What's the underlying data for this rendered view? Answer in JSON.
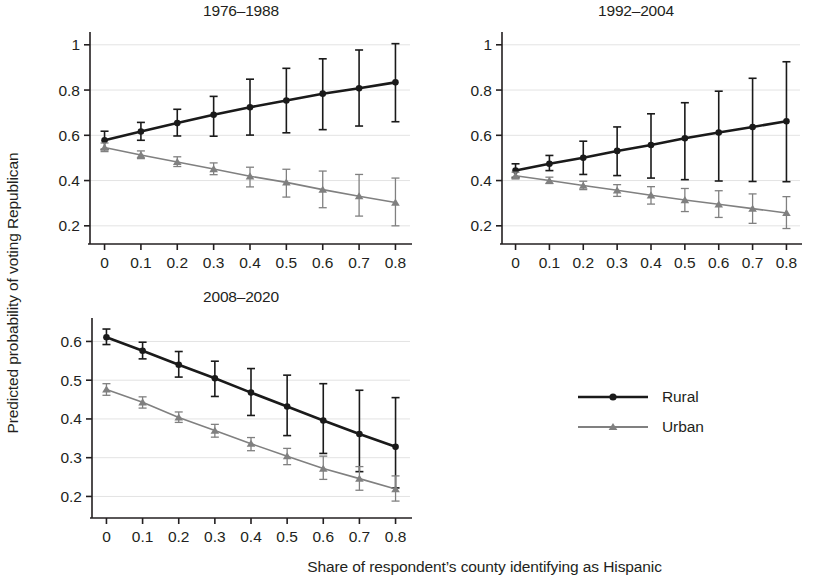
{
  "figure": {
    "xlabel": "Share of respondent’s county identifying as Hispanic",
    "ylabel": "Predicted probability of voting Republican",
    "width": 819,
    "height": 586,
    "background": "#ffffff"
  },
  "legend": {
    "position": "right-middle",
    "entries": [
      {
        "label": "Rural",
        "color": "#1a1a1a",
        "marker": "circle"
      },
      {
        "label": "Urban",
        "color": "#808080",
        "marker": "triangle"
      }
    ]
  },
  "colors": {
    "rural": "#1a1a1a",
    "urban": "#808080",
    "grid": "#e3e3e3",
    "axis": "#231f20",
    "text": "#231f20"
  },
  "chart_data": [
    {
      "type": "line",
      "title": "1976–1988",
      "xlabel": "",
      "ylabel": "",
      "x": [
        0,
        0.1,
        0.2,
        0.3,
        0.4,
        0.5,
        0.6,
        0.7,
        0.8
      ],
      "xticks": [
        "0",
        "0.1",
        "0.2",
        "0.3",
        "0.4",
        "0.5",
        "0.6",
        "0.7",
        "0.8"
      ],
      "yticks": [
        "0.2",
        "0.4",
        "0.6",
        "0.8",
        "1"
      ],
      "ytickvals": [
        0.2,
        0.4,
        0.6,
        0.8,
        1.0
      ],
      "xlim": [
        -0.04,
        0.84
      ],
      "ylim": [
        0.155,
        1.03
      ],
      "grid": true,
      "series": [
        {
          "name": "Rural",
          "color": "#1a1a1a",
          "marker": "circle",
          "values": [
            0.578,
            0.617,
            0.654,
            0.691,
            0.724,
            0.754,
            0.784,
            0.808,
            0.834
          ],
          "err_low": [
            0.538,
            0.578,
            0.597,
            0.596,
            0.601,
            0.611,
            0.625,
            0.641,
            0.66
          ],
          "err_high": [
            0.618,
            0.657,
            0.715,
            0.772,
            0.848,
            0.896,
            0.938,
            0.977,
            1.005
          ]
        },
        {
          "name": "Urban",
          "color": "#808080",
          "marker": "triangle",
          "values": [
            0.546,
            0.513,
            0.482,
            0.451,
            0.419,
            0.392,
            0.36,
            0.331,
            0.303
          ],
          "err_low": [
            0.528,
            0.497,
            0.462,
            0.426,
            0.372,
            0.327,
            0.28,
            0.243,
            0.2
          ],
          "err_high": [
            0.566,
            0.531,
            0.505,
            0.478,
            0.459,
            0.45,
            0.442,
            0.427,
            0.411
          ]
        }
      ]
    },
    {
      "type": "line",
      "title": "1992–2004",
      "xlabel": "",
      "ylabel": "",
      "x": [
        0,
        0.1,
        0.2,
        0.3,
        0.4,
        0.5,
        0.6,
        0.7,
        0.8
      ],
      "xticks": [
        "0",
        "0.1",
        "0.2",
        "0.3",
        "0.4",
        "0.5",
        "0.6",
        "0.7",
        "0.8"
      ],
      "yticks": [
        "0.2",
        "0.4",
        "0.6",
        "0.8",
        "1"
      ],
      "ytickvals": [
        0.2,
        0.4,
        0.6,
        0.8,
        1.0
      ],
      "xlim": [
        -0.04,
        0.84
      ],
      "ylim": [
        0.155,
        1.03
      ],
      "grid": true,
      "series": [
        {
          "name": "Rural",
          "color": "#1a1a1a",
          "marker": "circle",
          "values": [
            0.444,
            0.474,
            0.501,
            0.531,
            0.557,
            0.587,
            0.612,
            0.637,
            0.662
          ],
          "err_low": [
            0.414,
            0.444,
            0.427,
            0.422,
            0.411,
            0.404,
            0.398,
            0.396,
            0.395
          ],
          "err_high": [
            0.474,
            0.511,
            0.574,
            0.637,
            0.695,
            0.744,
            0.795,
            0.852,
            0.925
          ]
        },
        {
          "name": "Urban",
          "color": "#808080",
          "marker": "triangle",
          "values": [
            0.421,
            0.4,
            0.378,
            0.357,
            0.335,
            0.314,
            0.295,
            0.276,
            0.257
          ],
          "err_low": [
            0.407,
            0.387,
            0.36,
            0.33,
            0.296,
            0.263,
            0.237,
            0.211,
            0.188
          ],
          "err_high": [
            0.437,
            0.415,
            0.397,
            0.382,
            0.373,
            0.365,
            0.355,
            0.341,
            0.329
          ]
        }
      ]
    },
    {
      "type": "line",
      "title": "2008–2020",
      "xlabel": "",
      "ylabel": "",
      "x": [
        0,
        0.1,
        0.2,
        0.3,
        0.4,
        0.5,
        0.6,
        0.7,
        0.8
      ],
      "xticks": [
        "0",
        "0.1",
        "0.2",
        "0.3",
        "0.4",
        "0.5",
        "0.6",
        "0.7",
        "0.8"
      ],
      "yticks": [
        "0.2",
        "0.3",
        "0.4",
        "0.5",
        "0.6"
      ],
      "ytickvals": [
        0.2,
        0.3,
        0.4,
        0.5,
        0.6
      ],
      "xlim": [
        -0.04,
        0.84
      ],
      "ylim": [
        0.165,
        0.645
      ],
      "grid": true,
      "series": [
        {
          "name": "Rural",
          "color": "#1a1a1a",
          "marker": "circle",
          "values": [
            0.611,
            0.576,
            0.54,
            0.505,
            0.468,
            0.432,
            0.396,
            0.361,
            0.328
          ],
          "err_low": [
            0.592,
            0.555,
            0.508,
            0.458,
            0.409,
            0.357,
            0.311,
            0.264,
            0.222
          ],
          "err_high": [
            0.632,
            0.598,
            0.574,
            0.549,
            0.53,
            0.513,
            0.491,
            0.474,
            0.455
          ]
        },
        {
          "name": "Urban",
          "color": "#808080",
          "marker": "triangle",
          "values": [
            0.476,
            0.443,
            0.404,
            0.37,
            0.336,
            0.304,
            0.272,
            0.246,
            0.219
          ],
          "err_low": [
            0.461,
            0.428,
            0.391,
            0.353,
            0.318,
            0.282,
            0.244,
            0.216,
            0.188
          ],
          "err_high": [
            0.491,
            0.457,
            0.418,
            0.386,
            0.352,
            0.324,
            0.304,
            0.277,
            0.253
          ]
        }
      ]
    }
  ]
}
